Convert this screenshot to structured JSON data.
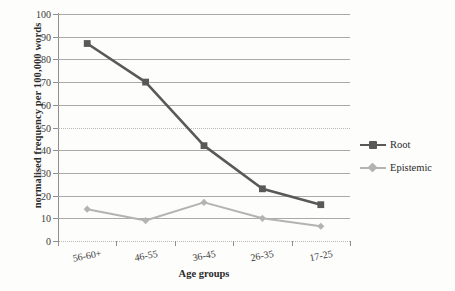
{
  "chart_data": {
    "type": "line",
    "title": "",
    "xlabel": "Age groups",
    "ylabel": "normalised frequency per 100,000 words",
    "categories": [
      "56-60+",
      "46-55",
      "36-45",
      "26-35",
      "17-25"
    ],
    "ylim": [
      0,
      100
    ],
    "ytick_step": 10,
    "yticks": [
      "100",
      "90",
      "80",
      "70",
      "60",
      "50",
      "40",
      "30",
      "20",
      "10",
      "0"
    ],
    "grid": "horizontal",
    "legend_position": "right",
    "series": [
      {
        "name": "Root",
        "values": [
          87,
          70,
          42,
          23,
          16
        ],
        "color": "#595959",
        "marker": "square"
      },
      {
        "name": "Epistemic",
        "values": [
          14,
          9,
          17,
          10,
          6.5
        ],
        "color": "#b3b3b3",
        "marker": "diamond"
      }
    ]
  },
  "axis": {
    "y_title": "normalised frequency per 100,000 words",
    "x_title": "Age groups"
  },
  "legend": {
    "items": [
      {
        "label": "Root"
      },
      {
        "label": "Epistemic"
      }
    ]
  },
  "colors": {
    "root": "#595959",
    "epistemic": "#b3b3b3",
    "grid": "#a9a9a9",
    "axis": "#8f8f8f",
    "text": "#2b2b2b",
    "background": "#fdfdfc"
  }
}
